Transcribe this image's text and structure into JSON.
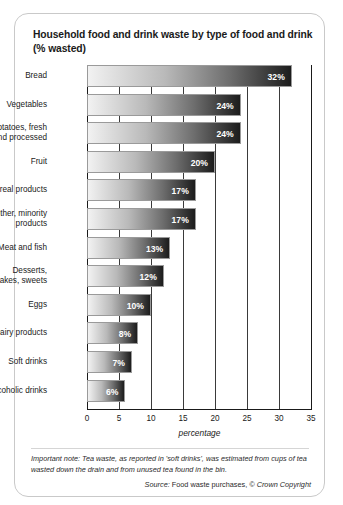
{
  "figure": {
    "title": "Household food and drink waste by type of food and drink (% wasted)",
    "footnote": "Important note: Tea waste, as reported in 'soft drinks', was estimated from cups of tea wasted down the drain and from unused tea found in the bin.",
    "source_label": "Source:",
    "source_text": "Food waste purchases,",
    "source_copyright": "© Crown Copyright"
  },
  "chart_data": {
    "type": "bar",
    "orientation": "horizontal",
    "title": "Household food and drink waste by type of food and drink (% wasted)",
    "xlabel": "percentage",
    "ylabel": "",
    "xlim": [
      0,
      35
    ],
    "xticks": [
      0,
      5,
      10,
      15,
      20,
      25,
      30,
      35
    ],
    "xtick_labels": [
      "0",
      "5",
      "10",
      "15",
      "20",
      "25",
      "30",
      "35"
    ],
    "grid": true,
    "legend": false,
    "value_suffix": "%",
    "categories": [
      "Bread",
      "Vegetables",
      "Potatoes, fresh and processed",
      "Fruit",
      "Cereal products",
      "Other, minority products",
      "Meat and fish",
      "Desserts, cakes, sweets",
      "Eggs",
      "Dairy products",
      "Soft drinks",
      "Alcoholic drinks"
    ],
    "values": [
      32,
      24,
      24,
      20,
      17,
      17,
      13,
      12,
      10,
      8,
      7,
      6
    ],
    "bars": [
      {
        "category": "Bread",
        "category_lines": [
          "Bread"
        ],
        "value": 32,
        "label": "32%"
      },
      {
        "category": "Vegetables",
        "category_lines": [
          "Vegetables"
        ],
        "value": 24,
        "label": "24%"
      },
      {
        "category": "Potatoes, fresh and processed",
        "category_lines": [
          "Potatoes, fresh",
          "and processed"
        ],
        "value": 24,
        "label": "24%"
      },
      {
        "category": "Fruit",
        "category_lines": [
          "Fruit"
        ],
        "value": 20,
        "label": "20%"
      },
      {
        "category": "Cereal products",
        "category_lines": [
          "Cereal products"
        ],
        "value": 17,
        "label": "17%"
      },
      {
        "category": "Other, minority products",
        "category_lines": [
          "Other, minority",
          "products"
        ],
        "value": 17,
        "label": "17%"
      },
      {
        "category": "Meat and fish",
        "category_lines": [
          "Meat and fish"
        ],
        "value": 13,
        "label": "13%"
      },
      {
        "category": "Desserts, cakes, sweets",
        "category_lines": [
          "Desserts,",
          "cakes, sweets"
        ],
        "value": 12,
        "label": "12%"
      },
      {
        "category": "Eggs",
        "category_lines": [
          "Eggs"
        ],
        "value": 10,
        "label": "10%"
      },
      {
        "category": "Dairy products",
        "category_lines": [
          "Dairy products"
        ],
        "value": 8,
        "label": "8%"
      },
      {
        "category": "Soft drinks",
        "category_lines": [
          "Soft drinks"
        ],
        "value": 7,
        "label": "7%"
      },
      {
        "category": "Alcoholic drinks",
        "category_lines": [
          "Alcoholic drinks"
        ],
        "value": 6,
        "label": "6%"
      }
    ],
    "colors": {
      "bar_gradient_start": "#f2f2f2",
      "bar_gradient_end": "#1c1c1c",
      "value_label": "#ffffff",
      "gridline": "#3a3a3a",
      "axis": "#1a1a1a",
      "text": "#1a1a1a",
      "card_border": "#c9c9c9",
      "background": "#ffffff"
    }
  }
}
